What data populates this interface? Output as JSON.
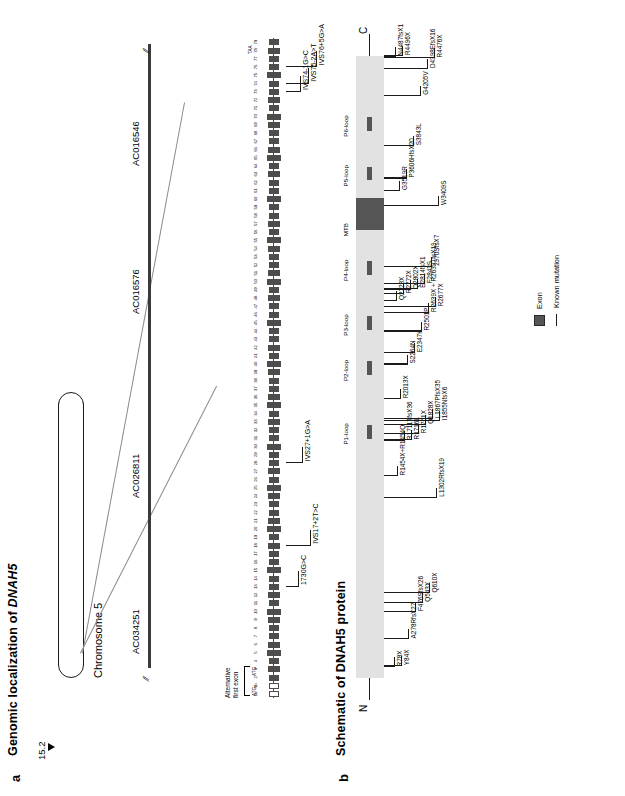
{
  "figure": {
    "panel_a": {
      "letter": "a",
      "title": "Genomic localization of DNAH5",
      "title_plain": "Genomic localization of ",
      "title_italic": "DNAH5",
      "chromosome_label": "Chromosome 5",
      "band_label": "15.2",
      "contigs": [
        "AC034251",
        "AC026811",
        "AC016576",
        "AC016546"
      ],
      "alternative_first_exon_label": "Alternative\nfirst exon",
      "alt_exon_line1": "Alternative",
      "alt_exon_line2": "first exon",
      "start_codon_label": "ATG",
      "stop_codon_label": "TAA",
      "exon_numbers": [
        "1a",
        "1b",
        "2",
        "3",
        "4",
        "5",
        "6",
        "7",
        "8",
        "9",
        "10",
        "11",
        "12",
        "13",
        "14",
        "15",
        "16",
        "17",
        "18",
        "19",
        "20",
        "21",
        "22",
        "23",
        "24",
        "25",
        "26",
        "27",
        "28",
        "29",
        "30",
        "31",
        "32",
        "33",
        "34",
        "35",
        "36",
        "37",
        "38",
        "39",
        "40",
        "41",
        "42",
        "43",
        "44",
        "45",
        "46",
        "47",
        "48",
        "49",
        "50",
        "51",
        "52",
        "53",
        "54",
        "55",
        "56",
        "57",
        "58",
        "59",
        "60",
        "61",
        "62",
        "63",
        "64",
        "65",
        "66",
        "67",
        "68",
        "69",
        "70",
        "71",
        "72",
        "73",
        "74",
        "75",
        "76",
        "77",
        "78",
        "79"
      ],
      "genomic_mutations": [
        {
          "label": "1730G>C",
          "exon_index": 13
        },
        {
          "label": "IVS17+2T>C",
          "exon_index": 18
        },
        {
          "label": "IVS27+1G>A",
          "exon_index": 28
        },
        {
          "label": "IVS74-1G>C",
          "exon_index": 73
        },
        {
          "label": "IVS75-2A>T",
          "exon_index": 74
        },
        {
          "label": "IVS76+5G>A",
          "exon_index": 76
        }
      ]
    },
    "panel_b": {
      "letter": "b",
      "title": "Schematic of DNAH5 protein",
      "n_terminus": "N",
      "c_terminus": "C",
      "domains": [
        {
          "name": "P1-loop",
          "pos": 0.385,
          "width": 0.022,
          "type": "loop"
        },
        {
          "name": "P2-loop",
          "pos": 0.487,
          "width": 0.022,
          "type": "loop"
        },
        {
          "name": "P3-loop",
          "pos": 0.56,
          "width": 0.022,
          "type": "loop"
        },
        {
          "name": "P4-loop",
          "pos": 0.648,
          "width": 0.022,
          "type": "loop"
        },
        {
          "name": "MTB",
          "pos": 0.72,
          "width": 0.052,
          "type": "mtb"
        },
        {
          "name": "P5-loop",
          "pos": 0.8,
          "width": 0.022,
          "type": "loop"
        },
        {
          "name": "P6-loop",
          "pos": 0.88,
          "width": 0.022,
          "type": "loop"
        }
      ],
      "mutations": [
        {
          "label": "R78X",
          "pos": 0.017
        },
        {
          "label": "Y84X",
          "pos": 0.019
        },
        {
          "label": "A278RfsX27",
          "pos": 0.062
        },
        {
          "label": "F476SfsX26",
          "pos": 0.106
        },
        {
          "label": "Q543X",
          "pos": 0.121
        },
        {
          "label": "Q610X",
          "pos": 0.136
        },
        {
          "label": "L1302RfsX19",
          "pos": 0.29
        },
        {
          "label": "R1454X+R1454Q",
          "pos": 0.324
        },
        {
          "label": "R1711TfsX36",
          "pos": 0.381
        },
        {
          "label": "R1716L",
          "pos": 0.382
        },
        {
          "label": "R1761X",
          "pos": 0.392
        },
        {
          "label": "Q1828X",
          "pos": 0.407
        },
        {
          "label": "L1867PfsX35",
          "pos": 0.416
        },
        {
          "label": "I1855NfsX6",
          "pos": 0.413
        },
        {
          "label": "R2013X",
          "pos": 0.448
        },
        {
          "label": "S2264N",
          "pos": 0.504
        },
        {
          "label": "E2347K",
          "pos": 0.522
        },
        {
          "label": "R2501P",
          "pos": 0.557
        },
        {
          "label": "R2639X + R2639TfsX19",
          "pos": 0.587
        },
        {
          "label": "R2677X",
          "pos": 0.596
        },
        {
          "label": "Q2723X",
          "pos": 0.606
        },
        {
          "label": "R2772X",
          "pos": 0.617
        },
        {
          "label": "Q2802X",
          "pos": 0.624
        },
        {
          "label": "E2814fsX1",
          "pos": 0.626
        },
        {
          "label": "F2843S",
          "pos": 0.633
        },
        {
          "label": "2970SfsX7",
          "pos": 0.661
        },
        {
          "label": "W3409S",
          "pos": 0.759
        },
        {
          "label": "G3519R",
          "pos": 0.783
        },
        {
          "label": "P3606HfsX20",
          "pos": 0.803
        },
        {
          "label": "S3843L",
          "pos": 0.855
        },
        {
          "label": "G4205V",
          "pos": 0.936
        },
        {
          "label": "D4398EfsX16",
          "pos": 0.979
        },
        {
          "label": "R4476X",
          "pos": 0.996
        },
        {
          "label": "N4487fsX1",
          "pos": 0.999
        },
        {
          "label": "R4496X",
          "pos": 1.0
        }
      ]
    },
    "legend": {
      "exon_label": "Exon",
      "mutation_label": "Known mutation",
      "exon_color": "#555555",
      "mutation_color": "#1a1a1a"
    }
  }
}
